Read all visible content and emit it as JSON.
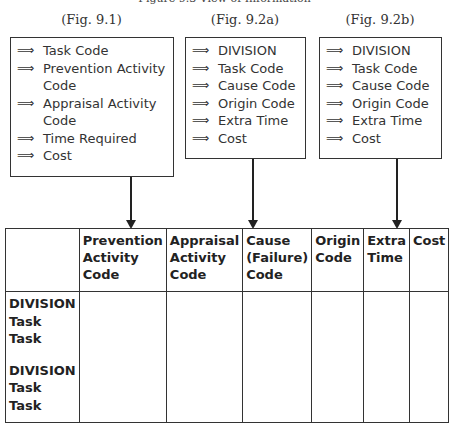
{
  "title": "Figure 9.3 View of Information",
  "figures": [
    {
      "label": "(Fig. 9.1)",
      "items": [
        "Task Code",
        "Prevention Activity Code",
        "Appraisal Activity Code",
        "Time Required",
        "Cost"
      ]
    },
    {
      "label": "(Fig. 9.2a)",
      "items": [
        "DIVISION",
        "Task Code",
        "Cause Code",
        "Origin Code",
        "Extra Time",
        "Cost"
      ]
    },
    {
      "label": "(Fig. 9.2b)",
      "items": [
        "DIVISION",
        "Task Code",
        "Cause Code",
        "Origin Code",
        "Extra Time",
        "Cost"
      ]
    }
  ],
  "arrow_glyph": "⟹",
  "table": {
    "headers": [
      "",
      "Prevention Activity Code",
      "Appraisal Activity Code",
      "Cause (Failure) Code",
      "Origin Code",
      "Extra Time",
      "Cost"
    ],
    "row_labels": [
      "DIVISION",
      "Task",
      "Task",
      "",
      "DIVISION",
      "Task",
      "Task"
    ]
  }
}
